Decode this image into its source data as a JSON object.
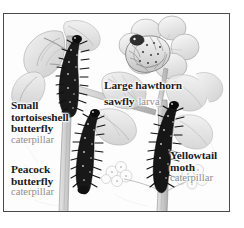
{
  "figure": {
    "kind": "natural-history-illustration",
    "frame_border_color": "#4a4a4a",
    "background_color": "#ffffff",
    "title_color": "#1c1c1c",
    "subtitle_color": "#8d8d8d"
  },
  "captions": [
    {
      "id": "small-tortoiseshell",
      "title_lines": [
        "Small",
        "tortoiseshell",
        "butterfly"
      ],
      "subtitle": "caterpillar"
    },
    {
      "id": "peacock",
      "title_lines": [
        "Peacock",
        "butterfly"
      ],
      "subtitle": "caterpillar"
    },
    {
      "id": "large-hawthorn",
      "title_lines": [
        "Large hawthorn",
        "sawfly"
      ],
      "subtitle": "larva"
    },
    {
      "id": "yellowtail",
      "title_lines": [
        "Yellowtail",
        "moth"
      ],
      "subtitle": "caterpillar"
    }
  ],
  "caption_text": {
    "small_tortoiseshell_l1": "Small",
    "small_tortoiseshell_l2": "tortoiseshell",
    "small_tortoiseshell_l3": "butterfly",
    "small_tortoiseshell_sub": "caterpillar",
    "peacock_l1": "Peacock",
    "peacock_l2": "butterfly",
    "peacock_sub": "caterpillar",
    "large_hawthorn_l1": "Large hawthorn",
    "large_hawthorn_l2": "sawfly",
    "large_hawthorn_sub": "larva",
    "yellowtail_l1": "Yellowtail",
    "yellowtail_l2": "moth",
    "yellowtail_sub": "caterpillar"
  },
  "subjects": [
    {
      "name": "small-tortoiseshell-caterpillar",
      "description": "dark spiny caterpillar on upright stem, upper left"
    },
    {
      "name": "peacock-caterpillar",
      "description": "dark spiny caterpillar on stem, centre lower"
    },
    {
      "name": "large-hawthorn-sawfly-larva",
      "description": "pale curled larva resting in open flower, top centre"
    },
    {
      "name": "yellowtail-moth-caterpillar",
      "description": "dark bristly caterpillar on stem, right side"
    },
    {
      "name": "hawthorn-foliage",
      "description": "pencil-shaded hawthorn leaves, stems and blossom"
    },
    {
      "name": "hawthorn-blossom-cluster",
      "description": "small flower clusters at base"
    }
  ]
}
